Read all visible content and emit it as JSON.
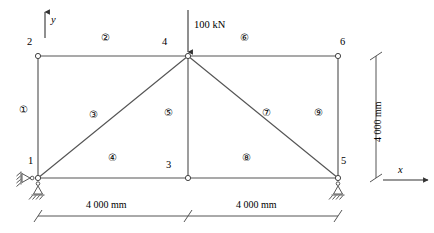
{
  "figure": {
    "type": "planar-truss-structural-diagram",
    "line_color": "#555555",
    "text_color": "#000000",
    "background": "#ffffff"
  },
  "axes": {
    "x_label": "x",
    "y_label": "y"
  },
  "load": {
    "label": "100 kN",
    "magnitude": 100,
    "unit": "kN",
    "direction": "down",
    "applied_at_node": "4"
  },
  "nodes": [
    {
      "id": "1",
      "label": "1",
      "x": 38,
      "y": 178,
      "label_x": 28,
      "label_y": 158
    },
    {
      "id": "2",
      "label": "2",
      "x": 38,
      "y": 56,
      "label_x": 28,
      "label_y": 39
    },
    {
      "id": "3",
      "label": "3",
      "x": 188,
      "y": 178,
      "label_x": 167,
      "label_y": 162
    },
    {
      "id": "4",
      "label": "4",
      "x": 188,
      "y": 56,
      "label_x": 163,
      "label_y": 39
    },
    {
      "id": "5",
      "label": "5",
      "x": 338,
      "y": 178,
      "label_x": 342,
      "label_y": 158
    },
    {
      "id": "6",
      "label": "6",
      "x": 338,
      "y": 56,
      "label_x": 340,
      "label_y": 39
    }
  ],
  "elements": [
    {
      "id": "1",
      "label": "①",
      "from": "1",
      "to": "2",
      "label_x": 24,
      "label_y": 112
    },
    {
      "id": "2",
      "label": "②",
      "from": "2",
      "to": "4",
      "label_x": 106,
      "label_y": 40
    },
    {
      "id": "3",
      "label": "③",
      "from": "1",
      "to": "4",
      "label_x": 94,
      "label_y": 117
    },
    {
      "id": "4",
      "label": "④",
      "from": "1",
      "to": "3",
      "label_x": 113,
      "label_y": 160
    },
    {
      "id": "5",
      "label": "⑤",
      "from": "3",
      "to": "4",
      "label_x": 169,
      "label_y": 115
    },
    {
      "id": "6",
      "label": "⑥",
      "from": "4",
      "to": "6",
      "label_x": 245,
      "label_y": 40
    },
    {
      "id": "7",
      "label": "⑦",
      "from": "4",
      "to": "5",
      "label_x": 267,
      "label_y": 115
    },
    {
      "id": "8",
      "label": "⑧",
      "from": "3",
      "to": "5",
      "label_x": 247,
      "label_y": 160
    },
    {
      "id": "9",
      "label": "⑨",
      "from": "5",
      "to": "6",
      "label_x": 319,
      "label_y": 115
    }
  ],
  "supports": [
    {
      "at_node": "1",
      "type": "pin-horizontal-left"
    },
    {
      "at_node": "1",
      "type": "roller-vertical-below"
    },
    {
      "at_node": "5",
      "type": "roller-vertical-below"
    }
  ],
  "dimensions": {
    "bottom_left": {
      "text": "4 000 mm",
      "value": 4000,
      "unit": "mm"
    },
    "bottom_right": {
      "text": "4 000 mm",
      "value": 4000,
      "unit": "mm"
    },
    "right_vertical": {
      "text": "4 000 mm",
      "value": 4000,
      "unit": "mm"
    }
  }
}
